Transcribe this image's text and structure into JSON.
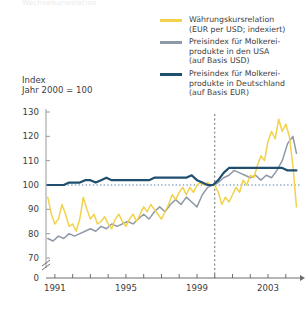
{
  "title_clipped": "Wechselkursrelation",
  "axis_caption": "Index\nJahr 2000 = 100",
  "legend": {
    "items": [
      {
        "label": "Währungskursrelation\n(EUR per USD; indexiert)",
        "color": "#F2D24B",
        "swatch_name": "legend-swatch-currency"
      },
      {
        "label": "Preisindex für Molkerei-\nprodukte in den USA\n(auf Basis USD)",
        "color": "#8E99A8",
        "swatch_name": "legend-swatch-usa"
      },
      {
        "label": "Preisindex für Molkerei-\nprodukte in Deutschland\n(auf Basis EUR)",
        "color": "#1F4E6E",
        "swatch_name": "legend-swatch-germany"
      }
    ]
  },
  "chart_data": {
    "type": "line",
    "title": "",
    "xlabel": "",
    "ylabel": "Index Jahr 2000 = 100",
    "ylim": [
      70,
      130
    ],
    "yticks": [
      70,
      80,
      90,
      100,
      110,
      120,
      130
    ],
    "zero_tick": "0",
    "axis_break": true,
    "grid": false,
    "legend_position": "top-right",
    "reference_line_y": 100,
    "reference_line_style": "dotted",
    "vertical_marker_x": 2000.0,
    "vertical_marker_style": "dashed",
    "xlim": [
      1990.5,
      2004.8
    ],
    "xticks": [
      1991,
      1992,
      1993,
      1994,
      1995,
      1996,
      1997,
      1998,
      1999,
      2000,
      2001,
      2002,
      2003,
      2004
    ],
    "xtick_labels_shown": [
      "1991",
      "1995",
      "1999",
      "2003"
    ],
    "series": [
      {
        "name": "Währungskursrelation (EUR per USD; indexiert)",
        "color": "#F2D24B",
        "x": [
          1990.6,
          1990.8,
          1991.0,
          1991.2,
          1991.4,
          1991.6,
          1991.8,
          1992.0,
          1992.2,
          1992.4,
          1992.6,
          1992.8,
          1993.0,
          1993.2,
          1993.4,
          1993.6,
          1993.8,
          1994.0,
          1994.2,
          1994.4,
          1994.6,
          1994.8,
          1995.0,
          1995.2,
          1995.4,
          1995.6,
          1995.8,
          1996.0,
          1996.2,
          1996.4,
          1996.6,
          1996.8,
          1997.0,
          1997.2,
          1997.4,
          1997.6,
          1997.8,
          1998.0,
          1998.2,
          1998.4,
          1998.6,
          1998.8,
          1999.0,
          1999.2,
          1999.4,
          1999.6,
          1999.8,
          2000.0,
          2000.2,
          2000.4,
          2000.6,
          2000.8,
          2001.0,
          2001.2,
          2001.4,
          2001.6,
          2001.8,
          2002.0,
          2002.2,
          2002.4,
          2002.6,
          2002.8,
          2003.0,
          2003.2,
          2003.4,
          2003.6,
          2003.8,
          2004.0,
          2004.2,
          2004.4,
          2004.6
        ],
        "y": [
          95,
          88,
          84,
          86,
          92,
          88,
          83,
          84,
          81,
          86,
          95,
          90,
          86,
          88,
          84,
          85,
          87,
          84,
          82,
          86,
          88,
          85,
          83,
          86,
          88,
          85,
          88,
          91,
          89,
          92,
          90,
          88,
          86,
          89,
          92,
          96,
          94,
          97,
          99,
          96,
          99,
          97,
          100,
          101,
          100,
          101,
          100,
          100,
          97,
          92,
          95,
          93,
          96,
          99,
          97,
          102,
          100,
          104,
          103,
          108,
          112,
          110,
          118,
          122,
          119,
          127,
          122,
          125,
          120,
          108,
          91
        ]
      },
      {
        "name": "Preisindex für Molkereiprodukte in den USA (auf Basis USD)",
        "color": "#8E99A8",
        "x": [
          1990.6,
          1990.9,
          1991.2,
          1991.5,
          1991.8,
          1992.1,
          1992.4,
          1992.7,
          1993.0,
          1993.3,
          1993.6,
          1993.9,
          1994.2,
          1994.5,
          1994.8,
          1995.1,
          1995.4,
          1995.7,
          1996.0,
          1996.3,
          1996.6,
          1996.9,
          1997.2,
          1997.5,
          1997.8,
          1998.1,
          1998.4,
          1998.7,
          1999.0,
          1999.3,
          1999.6,
          1999.9,
          2000.2,
          2000.5,
          2000.8,
          2001.1,
          2001.4,
          2001.7,
          2002.0,
          2002.3,
          2002.6,
          2002.9,
          2003.2,
          2003.5,
          2003.8,
          2004.1,
          2004.4,
          2004.6
        ],
        "y": [
          78,
          77,
          79,
          78,
          80,
          79,
          80,
          81,
          82,
          81,
          83,
          82,
          84,
          83,
          84,
          85,
          84,
          86,
          88,
          86,
          89,
          91,
          89,
          92,
          94,
          92,
          95,
          93,
          91,
          96,
          99,
          100,
          101,
          103,
          104,
          106,
          105,
          104,
          103,
          104,
          102,
          104,
          103,
          106,
          110,
          117,
          120,
          113
        ]
      },
      {
        "name": "Preisindex für Molkereiprodukte in Deutschland (auf Basis EUR)",
        "color": "#1F4E6E",
        "x": [
          1990.6,
          1990.9,
          1991.2,
          1991.5,
          1991.8,
          1992.1,
          1992.4,
          1992.7,
          1993.0,
          1993.3,
          1993.6,
          1993.9,
          1994.2,
          1994.5,
          1994.8,
          1995.1,
          1995.4,
          1995.7,
          1996.0,
          1996.3,
          1996.6,
          1996.9,
          1997.2,
          1997.5,
          1997.8,
          1998.1,
          1998.4,
          1998.7,
          1999.0,
          1999.3,
          1999.6,
          1999.9,
          2000.2,
          2000.5,
          2000.8,
          2001.1,
          2001.4,
          2001.7,
          2002.0,
          2002.3,
          2002.6,
          2002.9,
          2003.2,
          2003.5,
          2003.8,
          2004.1,
          2004.4,
          2004.6
        ],
        "y": [
          100,
          100,
          100,
          100,
          101,
          101,
          101,
          102,
          102,
          101,
          102,
          103,
          102,
          102,
          102,
          102,
          102,
          102,
          102,
          102,
          103,
          103,
          103,
          103,
          103,
          103,
          103,
          104,
          102,
          101,
          100,
          100,
          102,
          105,
          107,
          107,
          107,
          107,
          107,
          107,
          107,
          107,
          107,
          107,
          107,
          106,
          106,
          106
        ]
      }
    ]
  }
}
